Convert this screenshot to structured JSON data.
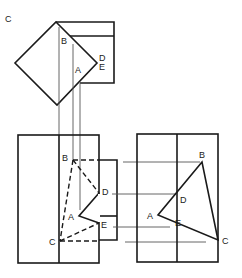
{
  "figure": {
    "type": "orthographic-projection-drawing",
    "line_color": "#1a1a1a",
    "projector_color": "#555555",
    "views": {
      "top_view": {
        "labels": [
          {
            "id": "C",
            "text": "C",
            "x": 5,
            "y": 14
          },
          {
            "id": "B",
            "text": "B",
            "x": 64,
            "y": 39
          },
          {
            "id": "A",
            "text": "A",
            "x": 77,
            "y": 68
          },
          {
            "id": "D",
            "text": "D",
            "x": 98,
            "y": 54
          },
          {
            "id": "E",
            "text": "E",
            "x": 98,
            "y": 63
          }
        ]
      },
      "front_view": {
        "labels": [
          {
            "id": "B",
            "text": "B",
            "x": 62,
            "y": 155
          },
          {
            "id": "D",
            "text": "D",
            "x": 102,
            "y": 188
          },
          {
            "id": "A",
            "text": "A",
            "x": 68,
            "y": 213
          },
          {
            "id": "E",
            "text": "E",
            "x": 101,
            "y": 222
          },
          {
            "id": "C",
            "text": "C",
            "x": 49,
            "y": 238
          }
        ]
      },
      "side_view": {
        "labels": [
          {
            "id": "B",
            "text": "B",
            "x": 199,
            "y": 152
          },
          {
            "id": "D",
            "text": "D",
            "x": 180,
            "y": 197
          },
          {
            "id": "A",
            "text": "A",
            "x": 147,
            "y": 212
          },
          {
            "id": "E",
            "text": "E",
            "x": 175,
            "y": 220
          },
          {
            "id": "C",
            "text": "C",
            "x": 222,
            "y": 237
          }
        ]
      }
    }
  }
}
